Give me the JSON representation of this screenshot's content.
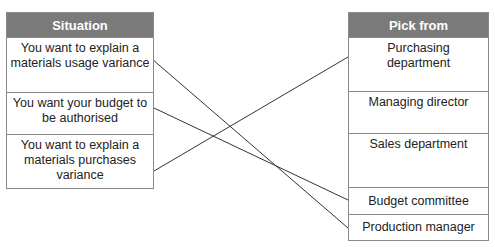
{
  "left_table": {
    "header": "Situation",
    "rows": [
      "You want to explain a materials usage variance",
      "You want your budget to be authorised",
      "You want to explain a materials purchases variance"
    ]
  },
  "right_table": {
    "header": "Pick from",
    "rows": [
      "Purchasing department",
      "Managing director",
      "Sales department",
      "Budget committee",
      "Production manager"
    ]
  },
  "connections": [
    {
      "from": "You want to explain a materials usage variance",
      "to": "Production manager"
    },
    {
      "from": "You want your budget to be authorised",
      "to": "Budget committee"
    },
    {
      "from": "You want to explain a materials purchases variance",
      "to": "Purchasing department"
    }
  ],
  "colors": {
    "header_bg": "#7a7a7a",
    "header_text": "#ffffff",
    "border": "#8a8a8a",
    "line": "#333333"
  }
}
